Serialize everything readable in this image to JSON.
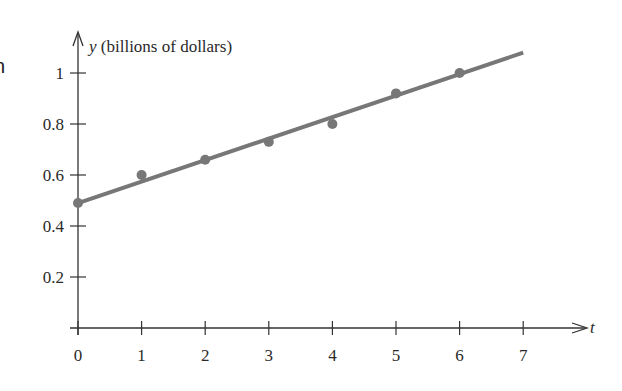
{
  "left_fragment": "n",
  "chart_data": {
    "type": "scatter",
    "title": "",
    "xlabel": "t",
    "ylabel_var": "y",
    "ylabel_unit": "(billions of dollars)",
    "x_ticks": [
      0,
      1,
      2,
      3,
      4,
      5,
      6,
      7
    ],
    "y_ticks": [
      0.2,
      0.4,
      0.6,
      0.8,
      1
    ],
    "y_tick_labels": [
      "0.2",
      "0.4",
      "0.6",
      "0.8",
      "1"
    ],
    "xlim": [
      0,
      7.5
    ],
    "ylim": [
      0,
      1.15
    ],
    "grid": false,
    "series": [
      {
        "name": "data",
        "kind": "points",
        "x": [
          0,
          1,
          2,
          3,
          4,
          5,
          6
        ],
        "y": [
          0.49,
          0.6,
          0.66,
          0.73,
          0.8,
          0.92,
          1.0
        ],
        "color": "#777777"
      },
      {
        "name": "fit line",
        "kind": "line",
        "x": [
          0,
          7
        ],
        "y": [
          0.49,
          1.08
        ],
        "color": "#777777"
      }
    ]
  }
}
